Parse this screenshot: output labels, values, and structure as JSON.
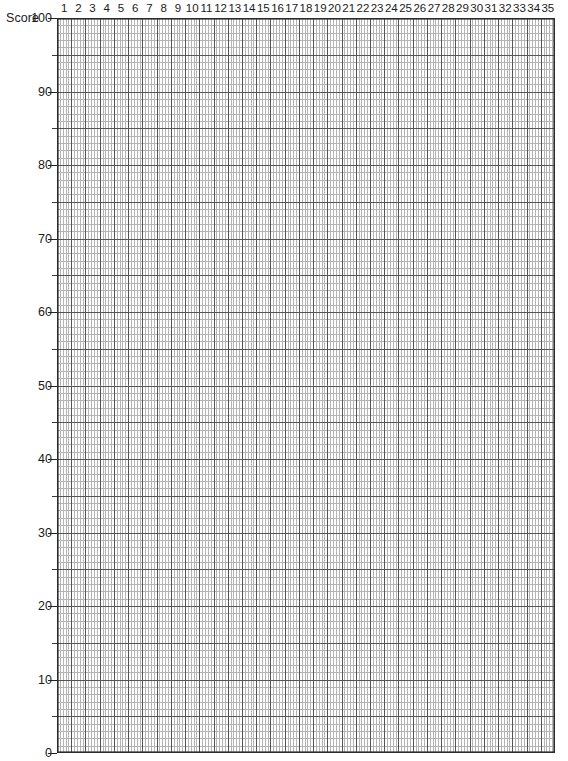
{
  "axis": {
    "y_title": "Score",
    "y_tick_labels": [
      "100",
      "90",
      "80",
      "70",
      "60",
      "50",
      "40",
      "30",
      "20",
      "10",
      "0"
    ],
    "x_tick_labels": [
      "1",
      "2",
      "3",
      "4",
      "5",
      "6",
      "7",
      "8",
      "9",
      "10",
      "11",
      "12",
      "13",
      "14",
      "15",
      "16",
      "17",
      "18",
      "19",
      "20",
      "21",
      "22",
      "23",
      "24",
      "25",
      "26",
      "27",
      "28",
      "29",
      "30",
      "31",
      "32",
      "33",
      "34",
      "35"
    ]
  },
  "colors": {
    "background": "#ffffff",
    "frame": "#2b2b2b",
    "major_gridline": "#555555",
    "minor_gridline": "#b4b4b4",
    "text": "#1a1a1a"
  },
  "chart_data": {
    "type": "line",
    "title": "",
    "subtitle": "",
    "xlabel": "",
    "ylabel": "Score",
    "xlim": [
      0,
      35
    ],
    "ylim": [
      0,
      100
    ],
    "grid": true,
    "legend": "none",
    "x_major_ticks": [
      1,
      2,
      3,
      4,
      5,
      6,
      7,
      8,
      9,
      10,
      11,
      12,
      13,
      14,
      15,
      16,
      17,
      18,
      19,
      20,
      21,
      22,
      23,
      24,
      25,
      26,
      27,
      28,
      29,
      30,
      31,
      32,
      33,
      34,
      35
    ],
    "y_major_ticks": [
      0,
      10,
      20,
      30,
      40,
      50,
      60,
      70,
      80,
      90,
      100
    ],
    "x_minor_subdivisions": 5,
    "y_minor_subdivisions": 10,
    "series": [],
    "annotations": [],
    "note": "Blank graph-paper grid: y-axis labelled Score 0-100 in steps of 10, x-axis columns numbered 1-35. No data plotted."
  }
}
